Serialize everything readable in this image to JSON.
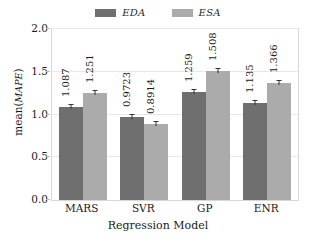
{
  "chart_data": {
    "type": "bar",
    "title": "",
    "xlabel": "Regression Model",
    "ylabel": "mean(MAPE)",
    "ylabel_plain": "mean(",
    "ylabel_italic": "MAPE",
    "ylabel_close": ")",
    "categories": [
      "MARS",
      "SVR",
      "GP",
      "ENR"
    ],
    "series": [
      {
        "name": "EDA",
        "color": "#6f6f6f",
        "values": [
          1.087,
          0.9723,
          1.259,
          1.135
        ],
        "labels": [
          "1.087",
          "0.9723",
          "1.259",
          "1.135"
        ]
      },
      {
        "name": "ESA",
        "color": "#ababab",
        "values": [
          1.251,
          0.8914,
          1.508,
          1.366
        ],
        "labels": [
          "1.251",
          "0.8914",
          "1.508",
          "1.366"
        ]
      }
    ],
    "ylim": [
      0.0,
      2.0
    ],
    "yticks": [
      "0.0",
      "0.5",
      "1.0",
      "1.5",
      "2.0"
    ],
    "ytick_values": [
      0.0,
      0.5,
      1.0,
      1.5,
      2.0
    ],
    "grid": true,
    "legend_position": "top-center",
    "legend": [
      "EDA",
      "ESA"
    ]
  }
}
